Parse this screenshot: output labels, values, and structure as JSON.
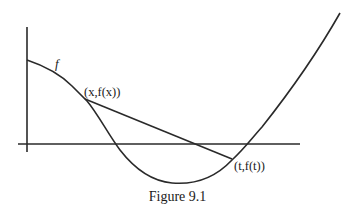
{
  "figure": {
    "caption": "Figure 9.1",
    "curve_label": "f",
    "point_x_label": "(x,f(x))",
    "point_t_label": "(t,f(t))"
  },
  "colors": {
    "stroke": "#2a2a2a",
    "background": "#ffffff"
  }
}
